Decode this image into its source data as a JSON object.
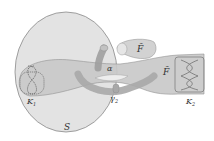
{
  "figure": {
    "labels": {
      "S": "S",
      "K1": "K",
      "K1_sub": "1",
      "K2": "K",
      "K2_sub": "2",
      "F_top": "F̃",
      "F_right": "F̃",
      "alpha": "α",
      "gamma": "γ",
      "gamma_sub": "2"
    },
    "colors": {
      "sphere_fill": "#e3e3e3",
      "sphere_stroke": "#8a8a8a",
      "surface_fill": "#c9c9c9",
      "surface_stroke": "#8c8c8c",
      "tube_fill": "#b0b0b0",
      "knot_stroke": "#555555"
    }
  }
}
